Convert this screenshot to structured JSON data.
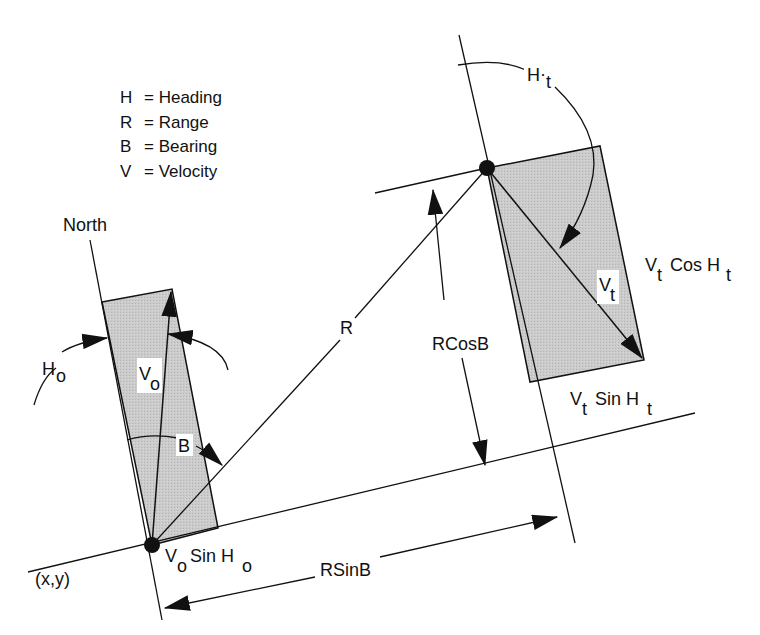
{
  "legend": {
    "items": [
      {
        "symbol": "H",
        "meaning": "= Heading"
      },
      {
        "symbol": "R",
        "meaning": "= Range"
      },
      {
        "symbol": "B",
        "meaning": "= Bearing"
      },
      {
        "symbol": "V",
        "meaning": "= Velocity"
      }
    ]
  },
  "labels": {
    "north": "North",
    "range": "R",
    "bearing": "B",
    "rcosb": "RCosB",
    "rsinb": "RSinB",
    "origin": "(x,y)",
    "ho_main": "H",
    "ho_sub": "o",
    "vo_main": "V",
    "vo_sub": "o",
    "ht_main": "H",
    "ht_dot": "·",
    "ht_sub": "t",
    "vt_main": "V",
    "vt_sub": "t",
    "vtcos_v": "V",
    "vtcos_t": "t",
    "vtcos_mid": "Cos H",
    "vtcos_t2": "t",
    "vtsin_v": "V",
    "vtsin_t": "t",
    "vtsin_mid": "Sin H",
    "vtsin_t2": "t",
    "vosin_v": "V",
    "vosin_o": "o",
    "vosin_mid": "Sin H",
    "vosin_o2": "o"
  },
  "colors": {
    "shade": "#c8c8c8",
    "ink": "#111111",
    "background": "#ffffff"
  }
}
